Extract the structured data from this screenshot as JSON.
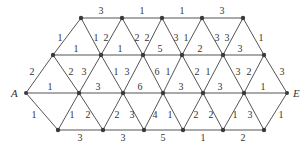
{
  "diagram": {
    "type": "weighted-triangular-grid-graph",
    "terminals": {
      "start": "A",
      "end": "E"
    },
    "colors": {
      "edge": "#555555",
      "node": "#3a3a3a",
      "text": "#333333"
    },
    "nodes": {
      "T0": [
        81,
        18
      ],
      "T1": [
        122,
        18
      ],
      "T2": [
        162,
        18
      ],
      "T3": [
        202,
        18
      ],
      "T4": [
        243,
        18
      ],
      "U0": [
        53,
        55
      ],
      "U1": [
        101,
        55
      ],
      "U2": [
        143,
        55
      ],
      "U3": [
        182,
        55
      ],
      "U4": [
        223,
        55
      ],
      "U5": [
        264,
        55
      ],
      "A": [
        26,
        93
      ],
      "M1": [
        79,
        93
      ],
      "M2": [
        123,
        93
      ],
      "M3": [
        163,
        93
      ],
      "M4": [
        203,
        93
      ],
      "M5": [
        244,
        93
      ],
      "E": [
        287,
        93
      ],
      "B0": [
        58,
        130
      ],
      "B1": [
        103,
        130
      ],
      "B2": [
        144,
        130
      ],
      "B3": [
        183,
        130
      ],
      "B4": [
        223,
        130
      ],
      "B5": [
        264,
        130
      ]
    },
    "edges": [
      {
        "from": "T0",
        "to": "T1",
        "w": "3",
        "lx": 101,
        "ly": 14
      },
      {
        "from": "T1",
        "to": "T2",
        "w": "1",
        "lx": 142,
        "ly": 14
      },
      {
        "from": "T2",
        "to": "T3",
        "w": "1",
        "lx": 182,
        "ly": 14
      },
      {
        "from": "T3",
        "to": "T4",
        "w": "3",
        "lx": 222,
        "ly": 14
      },
      {
        "from": "U0",
        "to": "T0",
        "w": "1",
        "lx": 60,
        "ly": 41
      },
      {
        "from": "T0",
        "to": "U1",
        "w": "1",
        "lx": 96,
        "ly": 41
      },
      {
        "from": "U1",
        "to": "T1",
        "w": "2",
        "lx": 106,
        "ly": 41
      },
      {
        "from": "T1",
        "to": "U2",
        "w": "2",
        "lx": 137,
        "ly": 41
      },
      {
        "from": "U2",
        "to": "T2",
        "w": "2",
        "lx": 147,
        "ly": 41
      },
      {
        "from": "T2",
        "to": "U3",
        "w": "3",
        "lx": 176,
        "ly": 41
      },
      {
        "from": "U3",
        "to": "T3",
        "w": "1",
        "lx": 186,
        "ly": 41
      },
      {
        "from": "T3",
        "to": "U4",
        "w": "3",
        "lx": 217,
        "ly": 41
      },
      {
        "from": "U4",
        "to": "T4",
        "w": "3",
        "lx": 227,
        "ly": 41
      },
      {
        "from": "T4",
        "to": "U5",
        "w": "1",
        "lx": 261,
        "ly": 41
      },
      {
        "from": "U0",
        "to": "U1",
        "w": "1",
        "lx": 76,
        "ly": 52
      },
      {
        "from": "U1",
        "to": "U2",
        "w": "1",
        "lx": 120,
        "ly": 52
      },
      {
        "from": "U2",
        "to": "U3",
        "w": "5",
        "lx": 160,
        "ly": 52
      },
      {
        "from": "U3",
        "to": "U4",
        "w": "2",
        "lx": 200,
        "ly": 52
      },
      {
        "from": "U4",
        "to": "U5",
        "w": "3",
        "lx": 240,
        "ly": 52
      },
      {
        "from": "A",
        "to": "U0",
        "w": "2",
        "lx": 32,
        "ly": 75
      },
      {
        "from": "U0",
        "to": "M1",
        "w": "2",
        "lx": 71,
        "ly": 75
      },
      {
        "from": "M1",
        "to": "U1",
        "w": "3",
        "lx": 84,
        "ly": 75
      },
      {
        "from": "U1",
        "to": "M2",
        "w": "1",
        "lx": 116,
        "ly": 75
      },
      {
        "from": "M2",
        "to": "U2",
        "w": "3",
        "lx": 127,
        "ly": 75
      },
      {
        "from": "U2",
        "to": "M3",
        "w": "6",
        "lx": 157,
        "ly": 75
      },
      {
        "from": "M3",
        "to": "U3",
        "w": "1",
        "lx": 168,
        "ly": 75
      },
      {
        "from": "U3",
        "to": "M4",
        "w": "2",
        "lx": 197,
        "ly": 75
      },
      {
        "from": "M4",
        "to": "U4",
        "w": "1",
        "lx": 208,
        "ly": 75
      },
      {
        "from": "U4",
        "to": "M5",
        "w": "3",
        "lx": 238,
        "ly": 75
      },
      {
        "from": "M5",
        "to": "U5",
        "w": "2",
        "lx": 249,
        "ly": 75
      },
      {
        "from": "U5",
        "to": "E",
        "w": "3",
        "lx": 282,
        "ly": 75
      },
      {
        "from": "A",
        "to": "M1",
        "w": "1",
        "lx": 50,
        "ly": 90
      },
      {
        "from": "M1",
        "to": "M2",
        "w": "3",
        "lx": 98,
        "ly": 90
      },
      {
        "from": "M2",
        "to": "M3",
        "w": "6",
        "lx": 140,
        "ly": 90
      },
      {
        "from": "M3",
        "to": "M4",
        "w": "3",
        "lx": 181,
        "ly": 90
      },
      {
        "from": "M4",
        "to": "M5",
        "w": "3",
        "lx": 220,
        "ly": 90
      },
      {
        "from": "M5",
        "to": "E",
        "w": "1",
        "lx": 263,
        "ly": 90
      },
      {
        "from": "A",
        "to": "B0",
        "w": "1",
        "lx": 34,
        "ly": 118
      },
      {
        "from": "B0",
        "to": "M1",
        "w": "1",
        "lx": 72,
        "ly": 118
      },
      {
        "from": "M1",
        "to": "B1",
        "w": "2",
        "lx": 88,
        "ly": 118
      },
      {
        "from": "B1",
        "to": "M2",
        "w": "2",
        "lx": 117,
        "ly": 118
      },
      {
        "from": "M2",
        "to": "B2",
        "w": "3",
        "lx": 132,
        "ly": 118
      },
      {
        "from": "B2",
        "to": "M3",
        "w": "4",
        "lx": 155,
        "ly": 118
      },
      {
        "from": "M3",
        "to": "B3",
        "w": "1",
        "lx": 170,
        "ly": 118
      },
      {
        "from": "B3",
        "to": "M4",
        "w": "2",
        "lx": 196,
        "ly": 118
      },
      {
        "from": "M4",
        "to": "B4",
        "w": "2",
        "lx": 211,
        "ly": 118
      },
      {
        "from": "B4",
        "to": "M5",
        "w": "1",
        "lx": 235,
        "ly": 118
      },
      {
        "from": "M5",
        "to": "B5",
        "w": "3",
        "lx": 250,
        "ly": 118
      },
      {
        "from": "B5",
        "to": "E",
        "w": "1",
        "lx": 281,
        "ly": 118
      },
      {
        "from": "B0",
        "to": "B1",
        "w": "3",
        "lx": 80,
        "ly": 141
      },
      {
        "from": "B1",
        "to": "B2",
        "w": "3",
        "lx": 123,
        "ly": 141
      },
      {
        "from": "B2",
        "to": "B3",
        "w": "5",
        "lx": 163,
        "ly": 141
      },
      {
        "from": "B3",
        "to": "B4",
        "w": "1",
        "lx": 203,
        "ly": 141
      },
      {
        "from": "B4",
        "to": "B5",
        "w": "2",
        "lx": 243,
        "ly": 141
      }
    ],
    "terminal_labels": [
      {
        "node": "A",
        "text": "A",
        "lx": 11,
        "ly": 97
      },
      {
        "node": "E",
        "text": "E",
        "lx": 293,
        "ly": 97
      }
    ]
  }
}
